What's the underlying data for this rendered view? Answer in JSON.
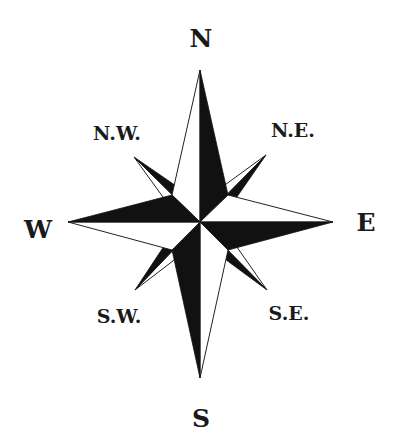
{
  "diagram": {
    "type": "compass-rose",
    "points": 8,
    "colors": {
      "dark": "#111111",
      "light": "#ffffff",
      "outline": "#222222",
      "text": "#1a1a1a"
    },
    "labels": {
      "n": "N",
      "ne": "N.E.",
      "e": "E",
      "se": "S.E.",
      "s": "S",
      "sw": "S.W.",
      "w": "W",
      "nw": "N.W."
    }
  }
}
